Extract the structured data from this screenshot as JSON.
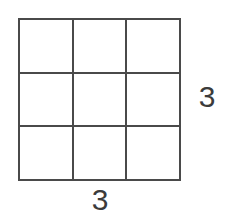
{
  "figure": {
    "kind": "square-grid-diagram",
    "background_color": "#ffffff",
    "line_color": "#4a4a4a",
    "label_color": "#3b3b3b"
  },
  "grid": {
    "rows": 3,
    "columns": 3,
    "cell_count": 9,
    "cells": [
      {
        "id": "r1c1",
        "label": ""
      },
      {
        "id": "r1c2",
        "label": ""
      },
      {
        "id": "r1c3",
        "label": ""
      },
      {
        "id": "r2c1",
        "label": ""
      },
      {
        "id": "r2c2",
        "label": ""
      },
      {
        "id": "r2c3",
        "label": ""
      },
      {
        "id": "r3c1",
        "label": ""
      },
      {
        "id": "r3c2",
        "label": ""
      },
      {
        "id": "r3c3",
        "label": ""
      }
    ]
  },
  "labels": {
    "right_dimension": "3",
    "bottom_dimension": "3"
  }
}
